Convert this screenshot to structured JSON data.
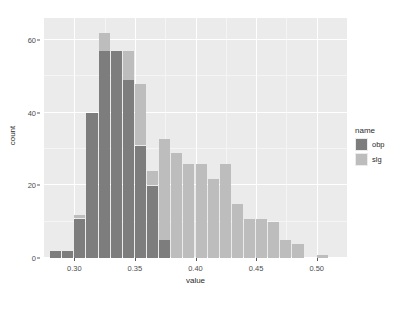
{
  "chart_data": {
    "type": "bar",
    "subtype": "stacked-histogram",
    "title": "",
    "xlabel": "value",
    "ylabel": "count",
    "xlim": [
      0.275,
      0.525
    ],
    "ylim": [
      0,
      66
    ],
    "grid": true,
    "legend": {
      "position": "right",
      "title": "name",
      "entries": [
        {
          "label": "obp",
          "color": "#7d7d7d"
        },
        {
          "label": "slg",
          "color": "#bdbdbd"
        }
      ]
    },
    "x_ticks": [
      {
        "value": 0.3,
        "label": "0.30"
      },
      {
        "value": 0.35,
        "label": "0.35"
      },
      {
        "value": 0.4,
        "label": "0.40"
      },
      {
        "value": 0.45,
        "label": "0.45"
      },
      {
        "value": 0.5,
        "label": "0.50"
      }
    ],
    "y_ticks": [
      {
        "value": 0,
        "label": "0"
      },
      {
        "value": 20,
        "label": "20"
      },
      {
        "value": 40,
        "label": "40"
      },
      {
        "value": 60,
        "label": "60"
      }
    ],
    "x_minor_ticks": [
      0.325,
      0.375,
      0.425,
      0.475
    ],
    "y_minor_ticks": [
      10,
      30,
      50
    ],
    "bin_width": 0.01,
    "bins": [
      {
        "x": 0.285,
        "obp": 2,
        "slg": 0
      },
      {
        "x": 0.295,
        "obp": 2,
        "slg": 0
      },
      {
        "x": 0.305,
        "obp": 11,
        "slg": 1
      },
      {
        "x": 0.315,
        "obp": 40,
        "slg": 0
      },
      {
        "x": 0.325,
        "obp": 57,
        "slg": 5
      },
      {
        "x": 0.335,
        "obp": 57,
        "slg": 0
      },
      {
        "x": 0.345,
        "obp": 49,
        "slg": 8
      },
      {
        "x": 0.355,
        "obp": 31,
        "slg": 17
      },
      {
        "x": 0.365,
        "obp": 20,
        "slg": 4
      },
      {
        "x": 0.375,
        "obp": 5,
        "slg": 28
      },
      {
        "x": 0.385,
        "obp": 0,
        "slg": 29
      },
      {
        "x": 0.395,
        "obp": 0,
        "slg": 26
      },
      {
        "x": 0.405,
        "obp": 0,
        "slg": 26
      },
      {
        "x": 0.415,
        "obp": 0,
        "slg": 22
      },
      {
        "x": 0.425,
        "obp": 0,
        "slg": 26
      },
      {
        "x": 0.435,
        "obp": 0,
        "slg": 15
      },
      {
        "x": 0.445,
        "obp": 0,
        "slg": 11
      },
      {
        "x": 0.455,
        "obp": 0,
        "slg": 11
      },
      {
        "x": 0.465,
        "obp": 0,
        "slg": 10
      },
      {
        "x": 0.475,
        "obp": 0,
        "slg": 5
      },
      {
        "x": 0.485,
        "obp": 0,
        "slg": 4
      },
      {
        "x": 0.505,
        "obp": 0,
        "slg": 1
      }
    ]
  },
  "colors": {
    "panel_background": "#ebebeb",
    "page_background": "#ffffff",
    "grid_major": "#ffffff",
    "grid_minor": "#f5f5f5",
    "axis_text": "#4d4d4d",
    "axis_title": "#2b2b2b"
  }
}
